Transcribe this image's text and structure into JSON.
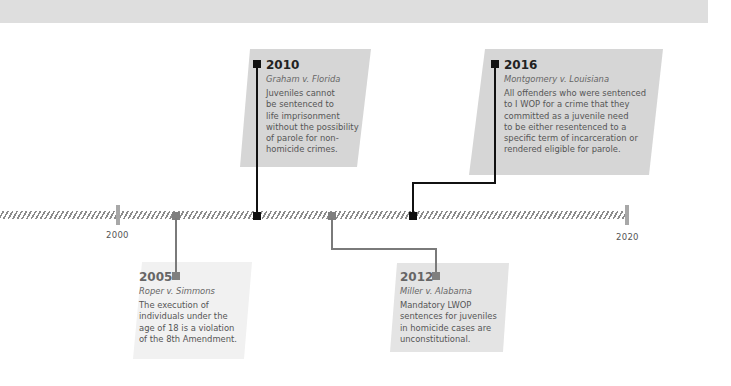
{
  "timeline": {
    "axis": {
      "start_label": "2000",
      "end_label": "2020",
      "colors": {
        "hatch": "#8c8c8c",
        "tick": "#a8a8a8"
      }
    },
    "events": [
      {
        "year": "2005",
        "case": "Roper v. Simmons",
        "description": [
          "The execution of",
          "individuals under the",
          "age of 18 is a violation",
          "of the 8th Amendment."
        ],
        "position": "below",
        "marker_color": "#7f7f7f"
      },
      {
        "year": "2010",
        "case": "Graham v. Florida",
        "description": [
          "Juveniles cannot",
          "be sentenced to",
          "life imprisonment",
          "without the possibility",
          "of parole for non-",
          "homicide crimes."
        ],
        "position": "above",
        "marker_color": "#111111"
      },
      {
        "year": "2012",
        "case": "Miller v. Alabama",
        "description": [
          "Mandatory LWOP",
          "sentences for juveniles",
          "in homicide cases are",
          "unconstitutional."
        ],
        "position": "below",
        "marker_color": "#7f7f7f"
      },
      {
        "year": "2016",
        "case": "Montgomery v. Louisiana",
        "description": [
          "All offenders who were sentenced",
          "to I WOP for a crime that they",
          "committed as a juvenile need",
          "to be either resentenced to a",
          "specific term of incarceration or",
          "rendered eligible for parole."
        ],
        "position": "above",
        "marker_color": "#111111"
      }
    ]
  }
}
